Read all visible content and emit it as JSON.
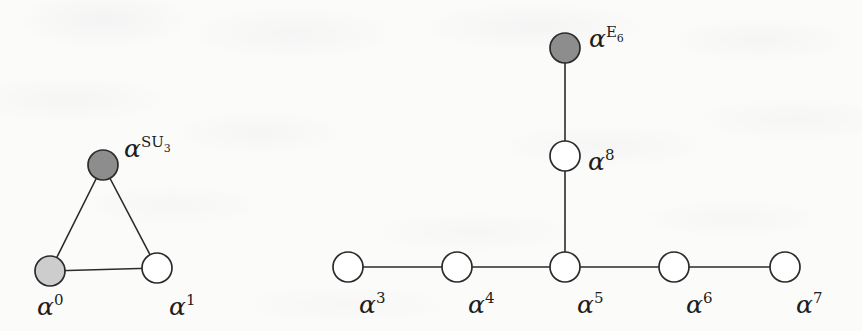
{
  "figure": {
    "background_color": "#fbfbfa",
    "stroke_color": "#2b2b2b",
    "node_fill_white": "#ffffff",
    "node_fill_light_gray": "#cdcdcd",
    "node_fill_dark_gray": "#8d8d8d",
    "node_radius": 15
  },
  "diagrams": [
    {
      "name": "left-triangle-diagram",
      "nodes": [
        {
          "id": "su3",
          "label_alpha": "α",
          "label_sup": "SU",
          "label_sub": "3",
          "fill": "dark-gray",
          "cx": 103,
          "cy": 165,
          "label_x": 124,
          "label_y": 157
        },
        {
          "id": "a0",
          "label_alpha": "α",
          "label_sup": "0",
          "label_sub": "",
          "fill": "light-gray",
          "cx": 50,
          "cy": 271,
          "label_x": 37,
          "label_y": 315
        },
        {
          "id": "a1",
          "label_alpha": "α",
          "label_sup": "1",
          "label_sub": "",
          "fill": "white",
          "cx": 157,
          "cy": 268,
          "label_x": 169,
          "label_y": 315
        }
      ],
      "edges": [
        {
          "from": "su3",
          "to": "a0"
        },
        {
          "from": "su3",
          "to": "a1"
        },
        {
          "from": "a0",
          "to": "a1"
        }
      ]
    },
    {
      "name": "right-tree-diagram",
      "nodes": [
        {
          "id": "e6",
          "label_alpha": "α",
          "label_sup": "E",
          "label_sub": "6",
          "fill": "dark-gray",
          "cx": 565,
          "cy": 48,
          "label_x": 589,
          "label_y": 47
        },
        {
          "id": "a8",
          "label_alpha": "α",
          "label_sup": "8",
          "label_sub": "",
          "fill": "white",
          "cx": 565,
          "cy": 156,
          "label_x": 588,
          "label_y": 170
        },
        {
          "id": "a3",
          "label_alpha": "α",
          "label_sup": "3",
          "label_sub": "",
          "fill": "white",
          "cx": 348,
          "cy": 267,
          "label_x": 359,
          "label_y": 313
        },
        {
          "id": "a4",
          "label_alpha": "α",
          "label_sup": "4",
          "label_sub": "",
          "fill": "white",
          "cx": 457,
          "cy": 267,
          "label_x": 468,
          "label_y": 313
        },
        {
          "id": "a5",
          "label_alpha": "α",
          "label_sup": "5",
          "label_sub": "",
          "fill": "white",
          "cx": 565,
          "cy": 267,
          "label_x": 577,
          "label_y": 313
        },
        {
          "id": "a6",
          "label_alpha": "α",
          "label_sup": "6",
          "label_sub": "",
          "fill": "white",
          "cx": 674,
          "cy": 267,
          "label_x": 686,
          "label_y": 313
        },
        {
          "id": "a7",
          "label_alpha": "α",
          "label_sup": "7",
          "label_sub": "",
          "fill": "white",
          "cx": 785,
          "cy": 267,
          "label_x": 796,
          "label_y": 313
        }
      ],
      "edges": [
        {
          "from": "e6",
          "to": "a8"
        },
        {
          "from": "a8",
          "to": "a5"
        },
        {
          "from": "a3",
          "to": "a4"
        },
        {
          "from": "a4",
          "to": "a5"
        },
        {
          "from": "a5",
          "to": "a6"
        },
        {
          "from": "a6",
          "to": "a7"
        }
      ]
    }
  ]
}
